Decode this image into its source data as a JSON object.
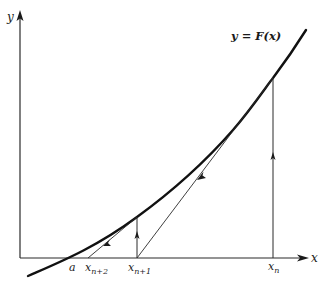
{
  "figure": {
    "curve_label": "y = F(x)",
    "axes": {
      "x_label": "x",
      "y_label": "y"
    },
    "points": {
      "root": {
        "label": "a"
      },
      "xn": {
        "base": "x",
        "sub": "n"
      },
      "xn1": {
        "base": "x",
        "sub": "n+1"
      },
      "xn2": {
        "base": "x",
        "sub": "n+2"
      }
    },
    "colors": {
      "curve": "#1a1a1a",
      "lines": "#2a2a2a",
      "background": "#ffffff"
    }
  }
}
